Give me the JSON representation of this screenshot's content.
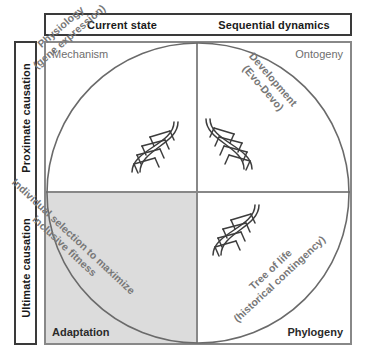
{
  "figure": {
    "name": "Tinbergen's four questions matrix",
    "circle_color": "#6a6a6a",
    "shaded_quadrant_color": "#dcdcdc",
    "frame_color": "#3a3a3a",
    "grid_color": "#888888",
    "caption_color": "#777777",
    "corner_label_light": "#6e6e6e",
    "corner_label_dark": "#2a2a2a"
  },
  "column_headers": [
    {
      "label": "Current state"
    },
    {
      "label": "Sequential dynamics"
    }
  ],
  "row_headers": [
    {
      "label": "Proximate causation"
    },
    {
      "label": "Ultimate causation"
    }
  ],
  "quadrants": [
    {
      "id": "mechanism",
      "corner_label": "Mechanism",
      "corner_position": "top-left",
      "caption_lines": [
        "Physiology",
        "(gene expression)"
      ],
      "rotation_degrees": -41,
      "shaded": false,
      "has_dna_icon": true
    },
    {
      "id": "ontogeny",
      "corner_label": "Ontogeny",
      "corner_position": "top-right",
      "caption_lines": [
        "Development",
        "(Evo-Devo)"
      ],
      "rotation_degrees": 49,
      "shaded": false,
      "has_dna_icon": true
    },
    {
      "id": "adaptation",
      "corner_label": "Adaptation",
      "corner_position": "bottom-left",
      "caption_lines": [
        "Individual selection to maximize",
        "inclusive fitness"
      ],
      "rotation_degrees": 43,
      "shaded": true,
      "has_dna_icon": false
    },
    {
      "id": "phylogeny",
      "corner_label": "Phylogeny",
      "corner_position": "bottom-right",
      "caption_lines": [
        "Tree of life",
        "(historical contingency)"
      ],
      "rotation_degrees": -43,
      "shaded": false,
      "has_dna_icon": true
    }
  ],
  "icons": {
    "dna_helix": "dna-helix-icon"
  }
}
